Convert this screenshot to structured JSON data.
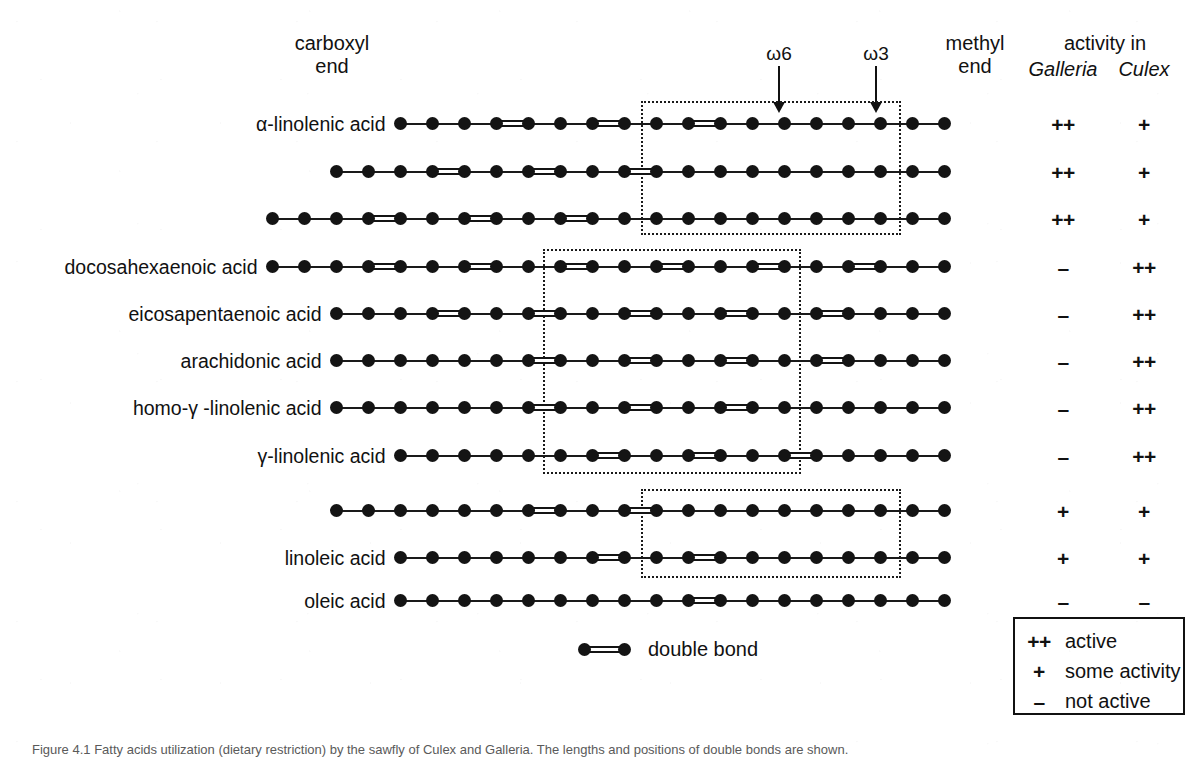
{
  "figure": {
    "headers": {
      "carboxyl_end": "carboxyl\nend",
      "methyl_end": "methyl\nend",
      "activity_in": "activity in",
      "species_1": "Galleria",
      "species_2": "Culex",
      "omega6": "ω6",
      "omega3": "ω3"
    },
    "double_bond_key": "double bond",
    "legend": {
      "items": [
        {
          "symbol": "++",
          "text": "active"
        },
        {
          "symbol": "+",
          "text": "some activity"
        },
        {
          "symbol": "–",
          "text": "not active"
        }
      ]
    },
    "caption": "Figure 4.1  Fatty acids utilization (dietary restriction) by the sawfly of Culex and Galleria. The lengths and positions of double bonds are shown.",
    "colors": {
      "ink": "#141414",
      "background": "#ffffff",
      "box_border": "#1a1a1a"
    },
    "rows": [
      {
        "label": "α-linolenic acid",
        "label_html": "&alpha;-linolenic acid",
        "carbons": 18,
        "double_bonds": [
          9,
          12,
          15
        ],
        "notation": "18:3",
        "galleria": "++",
        "culex": "+"
      },
      {
        "label": "",
        "label_html": "",
        "carbons": 20,
        "double_bonds": [
          11,
          14,
          17
        ],
        "notation": "20:3",
        "galleria": "++",
        "culex": "+"
      },
      {
        "label": "",
        "label_html": "",
        "carbons": 22,
        "double_bonds": [
          13,
          16,
          19
        ],
        "notation": "22:3",
        "galleria": "++",
        "culex": "+"
      },
      {
        "label": "docosahexaenoic acid",
        "label_html": "docosahexaenoic acid",
        "carbons": 22,
        "double_bonds": [
          4,
          7,
          10,
          13,
          16,
          19
        ],
        "notation": "22:6",
        "galleria": "–",
        "culex": "++"
      },
      {
        "label": "eicosapentaenoic acid",
        "label_html": "eicosapentaenoic acid",
        "carbons": 20,
        "double_bonds": [
          5,
          8,
          11,
          14,
          17
        ],
        "notation": "20:5",
        "galleria": "–",
        "culex": "++"
      },
      {
        "label": "arachidonic acid",
        "label_html": "arachidonic acid",
        "carbons": 20,
        "double_bonds": [
          5,
          8,
          11,
          14
        ],
        "notation": "20:4",
        "galleria": "–",
        "culex": "++"
      },
      {
        "label": "homo-γ -linolenic acid",
        "label_html": "homo-&gamma; -linolenic acid",
        "carbons": 20,
        "double_bonds": [
          8,
          11,
          14
        ],
        "notation": "20:3",
        "galleria": "–",
        "culex": "++"
      },
      {
        "label": "γ-linolenic acid",
        "label_html": "&nbsp;&gamma;-linolenic acid",
        "carbons": 18,
        "double_bonds": [
          6,
          9,
          12
        ],
        "notation": "18:3",
        "galleria": "–",
        "culex": "++"
      },
      {
        "label": "",
        "label_html": "",
        "carbons": 20,
        "double_bonds": [
          11,
          14
        ],
        "notation": "20:2",
        "galleria": "+",
        "culex": "+"
      },
      {
        "label": "linoleic acid",
        "label_html": "linoleic acid",
        "carbons": 18,
        "double_bonds": [
          9,
          12
        ],
        "notation": "18:2",
        "galleria": "+",
        "culex": "+"
      },
      {
        "label": "oleic acid",
        "label_html": "oleic acid",
        "carbons": 18,
        "double_bonds": [
          9
        ],
        "notation": "18:1",
        "galleria": "–",
        "culex": "–"
      }
    ]
  },
  "geometry": {
    "right_end_x": 944,
    "spacing": 32,
    "row_y": [
      124,
      172,
      219,
      267,
      314,
      361,
      408,
      456,
      511,
      558,
      601
    ],
    "omega6_box": {
      "x": 543,
      "y": 249,
      "w": 258,
      "h": 225
    },
    "omega3_box": {
      "x": 641,
      "y": 101,
      "w": 260,
      "h": 134
    },
    "omega_low_box": {
      "x": 641,
      "y": 489,
      "w": 260,
      "h": 89
    },
    "arrow_omega6_x": 779,
    "arrow_omega3_x": 876,
    "legend_box": {
      "x": 1013,
      "y": 617,
      "w": 172,
      "h": 98
    }
  }
}
